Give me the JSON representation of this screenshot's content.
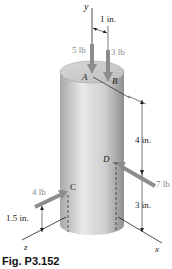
{
  "figure": {
    "caption": "Fig. P3.152",
    "axes": {
      "x": "x",
      "y": "y",
      "z": "z"
    },
    "points": {
      "A": "A",
      "B": "B",
      "C": "C",
      "D": "D"
    },
    "forces": [
      {
        "label": "5 lb",
        "point": "A",
        "direction": "down"
      },
      {
        "label": "3 lb",
        "point": "B",
        "direction": "down"
      },
      {
        "label": "4 lb",
        "point": "C",
        "direction": "toward +x"
      },
      {
        "label": "7 lb",
        "point": "D",
        "direction": "toward -x"
      }
    ],
    "dimensions": {
      "top_offset": "1 in.",
      "upper_height": "4 in.",
      "lower_height": "3 in.",
      "c_height": "1.5 in."
    },
    "colors": {
      "cylinder_light": "#e6e6e6",
      "cylinder_dark": "#9a9a9a",
      "force_arrow": "#8c8c8c",
      "line": "#222222"
    }
  }
}
